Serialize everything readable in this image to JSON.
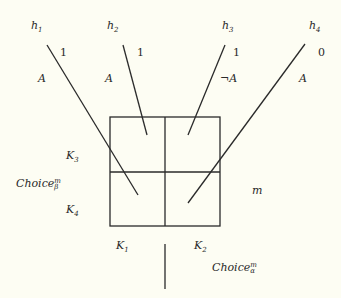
{
  "histories": [
    {
      "name": "h",
      "index": "1",
      "value": "1",
      "action": "A"
    },
    {
      "name": "h",
      "index": "2",
      "value": "1",
      "action": "A"
    },
    {
      "name": "h",
      "index": "3",
      "value": "1",
      "action": "¬A"
    },
    {
      "name": "h",
      "index": "4",
      "value": "0",
      "action": "A"
    }
  ],
  "cells": {
    "K1": {
      "name": "K",
      "index": "1"
    },
    "K2": {
      "name": "K",
      "index": "2"
    },
    "K3": {
      "name": "K",
      "index": "3"
    },
    "K4": {
      "name": "K",
      "index": "4"
    }
  },
  "choice_beta": {
    "name": "Choice",
    "sup": "m",
    "sub": "β"
  },
  "choice_alpha": {
    "name": "Choice",
    "sup": "m",
    "sub": "α"
  },
  "m_label": "m",
  "colors": {
    "line": "#2a2a2a",
    "background": "#fdfdf3"
  }
}
